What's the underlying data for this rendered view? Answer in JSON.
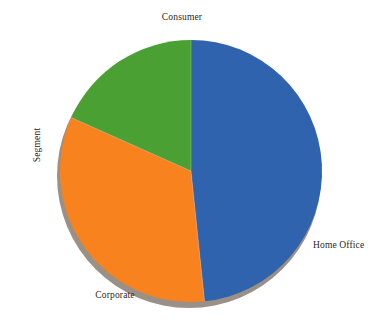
{
  "chart_data": {
    "type": "pie",
    "title": "",
    "axis_title": "Segment",
    "categories": [
      "Consumer",
      "Corporate",
      "Home Office"
    ],
    "values": [
      48.3,
      33.3,
      18.3
    ],
    "value_unit": "percent",
    "colors": [
      "#2f63ae",
      "#f8821e",
      "#4aa033"
    ],
    "legend": "none",
    "labels_position": "outside",
    "grid": false,
    "start_angle_deg": 90,
    "direction": "clockwise",
    "slice_angles_deg": [
      174,
      120,
      66
    ],
    "shadow_color": "#9b9086",
    "background": "#ffffff"
  },
  "labels": {
    "consumer": "Consumer",
    "corporate": "Corporate",
    "home_office": "Home Office"
  },
  "axis": {
    "segment_title": "Segment"
  },
  "geometry": {
    "center_x": 191,
    "center_y": 171,
    "radius": 131
  }
}
